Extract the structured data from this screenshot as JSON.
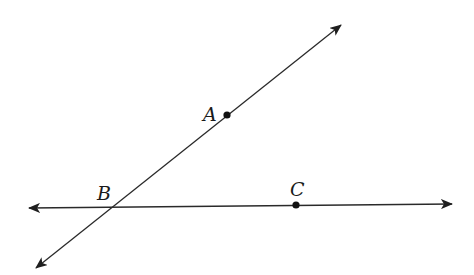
{
  "diagram": {
    "type": "geometry",
    "colors": {
      "line": "#2a2a2a",
      "point": "#111111",
      "label": "#1a1a1a"
    },
    "points": [
      {
        "id": "A",
        "label": "A",
        "x": 227,
        "y": 115,
        "label_x": 210,
        "label_y": 120
      },
      {
        "id": "B",
        "label": "B",
        "x": 111,
        "y": 207,
        "label_x": 104,
        "label_y": 200
      },
      {
        "id": "C",
        "label": "C",
        "x": 296,
        "y": 205,
        "label_x": 297,
        "label_y": 196
      }
    ],
    "lines": [
      {
        "id": "line-AB",
        "name": "Line AB",
        "x1": 36,
        "y1": 268,
        "x2": 341,
        "y2": 25,
        "arrow_start": true,
        "arrow_end": true
      },
      {
        "id": "line-BC",
        "name": "Line BC",
        "x1": 29,
        "y1": 208,
        "x2": 452,
        "y2": 204,
        "arrow_start": true,
        "arrow_end": true
      }
    ]
  }
}
